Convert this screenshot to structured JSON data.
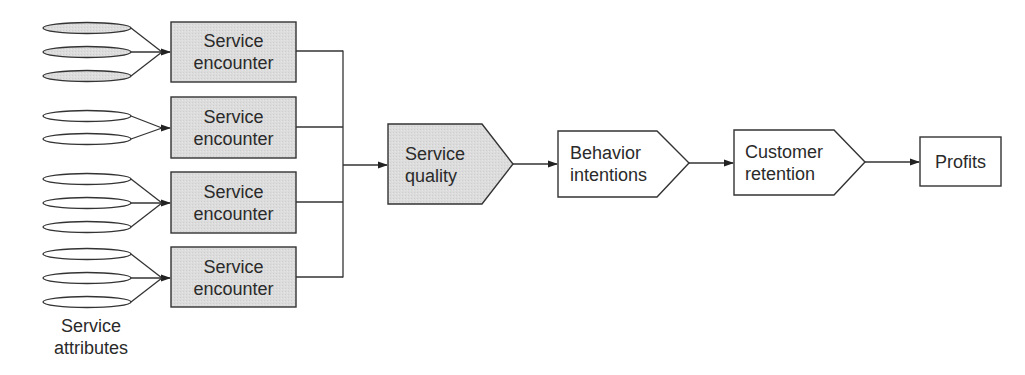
{
  "colors": {
    "shaded_fill": "#dcdcdc",
    "plain_fill": "#ffffff",
    "stroke": "#333333",
    "text": "#2a2a2a"
  },
  "attributes": {
    "label_line1": "Service",
    "label_line2": "attributes",
    "groups": [
      {
        "count": 3,
        "shaded": true
      },
      {
        "count": 2,
        "shaded": false
      },
      {
        "count": 3,
        "shaded": false
      },
      {
        "count": 3,
        "shaded": false
      }
    ]
  },
  "encounters": [
    {
      "line1": "Service",
      "line2": "encounter"
    },
    {
      "line1": "Service",
      "line2": "encounter"
    },
    {
      "line1": "Service",
      "line2": "encounter"
    },
    {
      "line1": "Service",
      "line2": "encounter"
    }
  ],
  "chain": {
    "service_quality": {
      "line1": "Service",
      "line2": "quality",
      "shaded": true
    },
    "behavior_intentions": {
      "line1": "Behavior",
      "line2": "intentions",
      "shaded": false
    },
    "customer_retention": {
      "line1": "Customer",
      "line2": "retention",
      "shaded": false
    },
    "profits": {
      "label": "Profits",
      "shaded": false
    }
  }
}
